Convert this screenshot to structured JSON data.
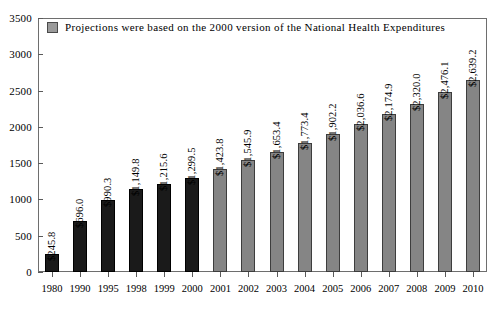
{
  "chart_data": {
    "type": "bar",
    "title": "",
    "subtitle": "",
    "xlabel": "",
    "ylabel": "",
    "ylim": [
      0,
      3500
    ],
    "ytick_step": 500,
    "ytick_labels": [
      "0",
      "500",
      "1000",
      "1500",
      "2000",
      "2500",
      "3000",
      "3500"
    ],
    "grid": false,
    "legend_position": "top-left",
    "legend": [
      {
        "label": "Projections were based on the 2000 version of the National Health Expenditures",
        "color": "#9a9a9a"
      }
    ],
    "categories": [
      "1980",
      "1990",
      "1995",
      "1998",
      "1999",
      "2000",
      "2001",
      "2002",
      "2003",
      "2004",
      "2005",
      "2006",
      "2007",
      "2008",
      "2009",
      "2010"
    ],
    "values": [
      245.8,
      696.0,
      990.3,
      1149.8,
      1215.6,
      1299.5,
      1423.8,
      1545.9,
      1653.4,
      1773.4,
      1902.2,
      2036.6,
      2174.9,
      2320.0,
      2476.1,
      2639.2
    ],
    "value_labels": [
      "$245.8",
      "$696.0",
      "$990.3",
      "$1,149.8",
      "$1,215.6",
      "$1,299.5",
      "$1,423.8",
      "$1,545.9",
      "$1,653.4",
      "$1,773.4",
      "$1,902.2",
      "$2,036.6",
      "$2,174.9",
      "$2,320.0",
      "$2,476.1",
      "$2,639.2"
    ],
    "kinds": [
      "historical",
      "historical",
      "historical",
      "historical",
      "historical",
      "historical",
      "projection",
      "projection",
      "projection",
      "projection",
      "projection",
      "projection",
      "projection",
      "projection",
      "projection",
      "projection"
    ],
    "colors": {
      "historical": "#1a1a1a",
      "projection": "#858585",
      "axis": "#6e6e6e",
      "text": "#000000"
    }
  }
}
